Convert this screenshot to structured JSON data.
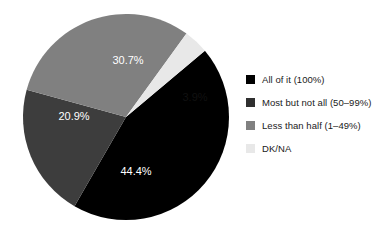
{
  "chart_data": {
    "type": "pie",
    "title": "",
    "subtitle": "",
    "xlabel": "",
    "ylabel": "",
    "grid": false,
    "legend_position": "right",
    "start_angle_deg": 50,
    "direction": "clockwise",
    "categories": [
      "All of it (100%)",
      "Most but not all (50–99%)",
      "Less than half (1–49%)",
      "DK/NA"
    ],
    "values": [
      44.4,
      20.9,
      30.7,
      3.9
    ],
    "data_labels": [
      "44.4%",
      "20.9%",
      "30.7%",
      "3.9%"
    ],
    "colors": [
      "#000000",
      "#3d3d3d",
      "#808080",
      "#e8e8e8"
    ],
    "slices": [
      {
        "label": "All of it (100%)",
        "value": 44.4,
        "data_label": "44.4%",
        "color": "#000000",
        "label_color": "#ffffff",
        "label_x": 136,
        "label_y": 172
      },
      {
        "label": "Most but not all (50–99%)",
        "value": 20.9,
        "data_label": "20.9%",
        "color": "#3d3d3d",
        "label_color": "#ffffff",
        "label_x": 74,
        "label_y": 117
      },
      {
        "label": "Less than half (1–49%)",
        "value": 30.7,
        "data_label": "30.7%",
        "color": "#808080",
        "label_color": "#ffffff",
        "label_x": 128,
        "label_y": 61
      },
      {
        "label": "DK/NA",
        "value": 3.9,
        "data_label": "3.9%",
        "color": "#e8e8e8",
        "label_color": "#111111",
        "label_x": 195,
        "label_y": 98
      }
    ]
  },
  "legend": {
    "items": [
      {
        "label": "All of it (100%)",
        "color": "#000000"
      },
      {
        "label": "Most but not all (50–99%)",
        "color": "#2f2f2f"
      },
      {
        "label": "Less than half (1–49%)",
        "color": "#808080"
      },
      {
        "label": "DK/NA",
        "color": "#e8e8e8"
      }
    ]
  }
}
